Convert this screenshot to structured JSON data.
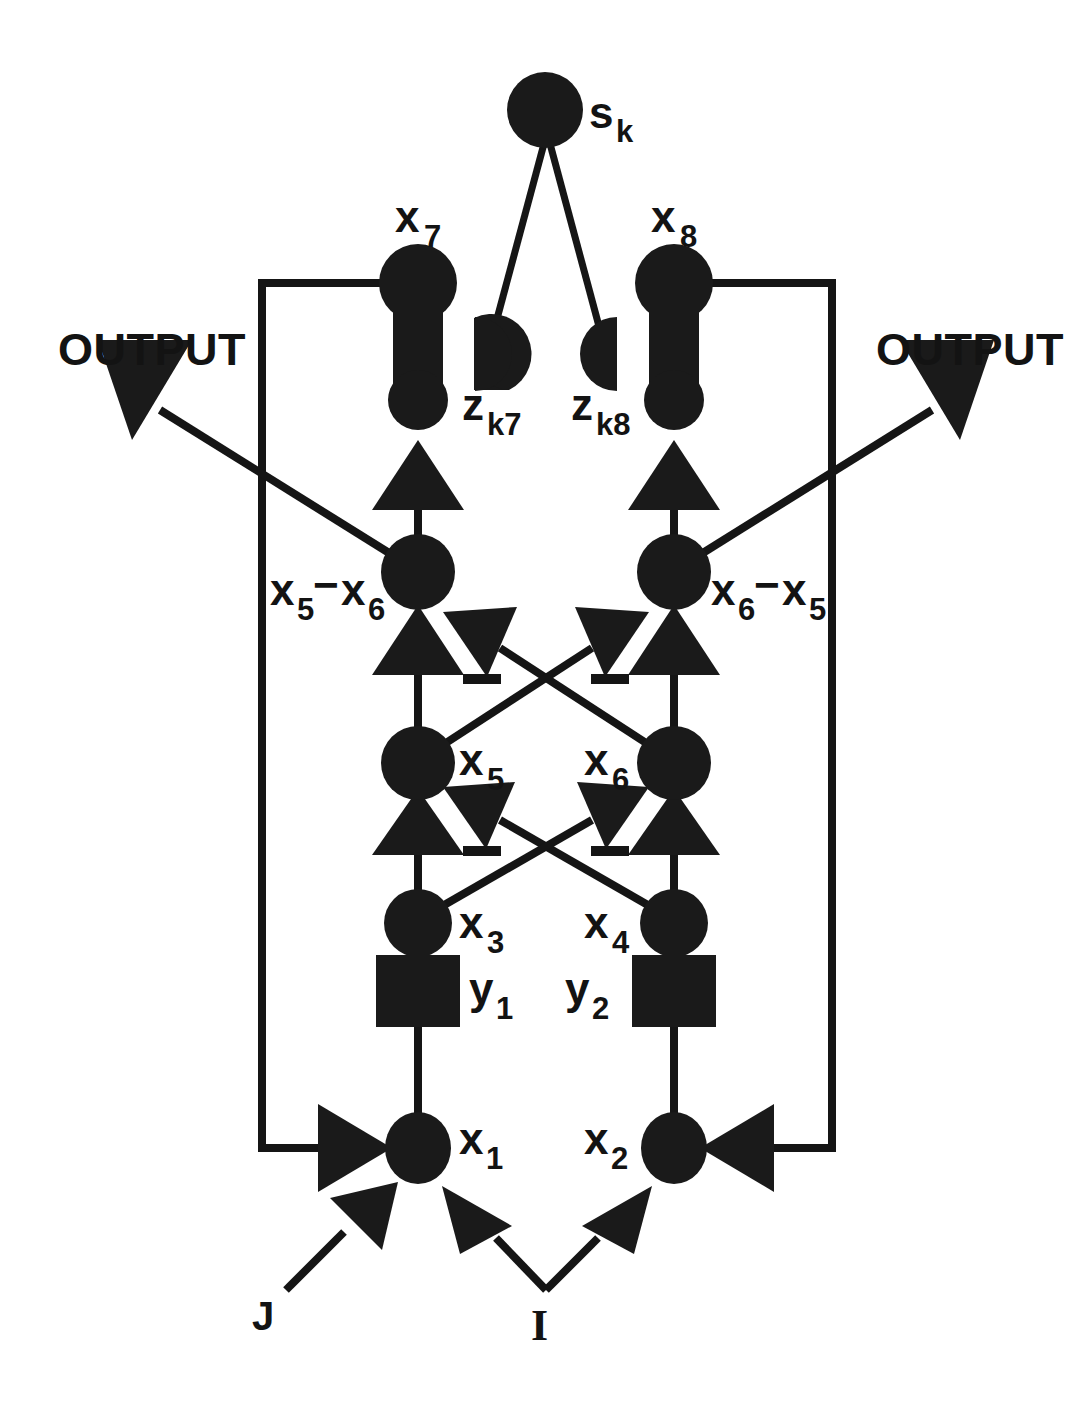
{
  "figure": {
    "type": "neural-circuit-block-diagram",
    "title_visible": false,
    "background_color": "#ffffff",
    "ink_color": "#1a1a1a"
  },
  "nodes": {
    "sk": {
      "label": "s",
      "subscript": "k",
      "shape": "filled-circle",
      "x": 545,
      "y": 110
    },
    "zk7": {
      "label": "z",
      "subscript": "k7",
      "shape": "half-disc-right",
      "x": 492,
      "y": 352
    },
    "zk8": {
      "label": "z",
      "subscript": "k8",
      "shape": "half-disc-left",
      "x": 600,
      "y": 352
    },
    "x7": {
      "label": "x",
      "subscript": "7",
      "shape": "dumbbell",
      "x": 418,
      "y": 283
    },
    "x8": {
      "label": "x",
      "subscript": "8",
      "shape": "dumbbell",
      "x": 674,
      "y": 283
    },
    "x5mx6": {
      "label": "x₅−x₆",
      "left_term": "x",
      "left_sub": "5",
      "op": "−",
      "right_term": "x",
      "right_sub": "6",
      "shape": "filled-circle",
      "x": 418,
      "y": 572
    },
    "x6mx5": {
      "label": "x₆−x₅",
      "left_term": "x",
      "left_sub": "6",
      "op": "−",
      "right_term": "x",
      "right_sub": "5",
      "shape": "filled-circle",
      "x": 674,
      "y": 572
    },
    "x5": {
      "label": "x",
      "subscript": "5",
      "shape": "filled-circle",
      "x": 418,
      "y": 763
    },
    "x6": {
      "label": "x",
      "subscript": "6",
      "shape": "filled-circle",
      "x": 674,
      "y": 763
    },
    "x3": {
      "label": "x",
      "subscript": "3",
      "shape": "filled-circle",
      "x": 418,
      "y": 923
    },
    "x4": {
      "label": "x",
      "subscript": "4",
      "shape": "filled-circle",
      "x": 674,
      "y": 923
    },
    "y1": {
      "label": "y",
      "subscript": "1",
      "shape": "filled-square",
      "x": 418,
      "y": 990
    },
    "y2": {
      "label": "y",
      "subscript": "2",
      "shape": "filled-square",
      "x": 674,
      "y": 990
    },
    "x1": {
      "label": "x",
      "subscript": "1",
      "shape": "filled-circle",
      "x": 418,
      "y": 1148
    },
    "x2": {
      "label": "x",
      "subscript": "2",
      "shape": "filled-circle",
      "x": 674,
      "y": 1148
    }
  },
  "labels": {
    "output_left": "OUTPUT",
    "output_right": "OUTPUT",
    "input_j": "J",
    "input_i": "I",
    "minus_signs": [
      "−",
      "−",
      "−",
      "−"
    ]
  },
  "edges": [
    {
      "from": "sk",
      "to": "zk7",
      "style": "line",
      "sign": ""
    },
    {
      "from": "sk",
      "to": "zk8",
      "style": "line",
      "sign": ""
    },
    {
      "from": "x5mx6",
      "to": "x7",
      "style": "arrow-up",
      "sign": "+"
    },
    {
      "from": "x6mx5",
      "to": "x8",
      "style": "arrow-up",
      "sign": "+"
    },
    {
      "from": "x5",
      "to": "x5mx6",
      "style": "arrow-up",
      "sign": "+"
    },
    {
      "from": "x6",
      "to": "x6mx5",
      "style": "arrow-up",
      "sign": "+"
    },
    {
      "from": "x6",
      "to": "x5mx6",
      "style": "arrow-up-left",
      "sign": "−"
    },
    {
      "from": "x5",
      "to": "x6mx5",
      "style": "arrow-up-right",
      "sign": "−"
    },
    {
      "from": "x3",
      "to": "x5",
      "style": "arrow-up",
      "sign": "+"
    },
    {
      "from": "x4",
      "to": "x6",
      "style": "arrow-up",
      "sign": "+"
    },
    {
      "from": "x4",
      "to": "x5",
      "style": "arrow-up-left",
      "sign": "−"
    },
    {
      "from": "x3",
      "to": "x6",
      "style": "arrow-up-right",
      "sign": "−"
    },
    {
      "from": "y1",
      "to": "x3",
      "style": "line",
      "sign": ""
    },
    {
      "from": "y2",
      "to": "x4",
      "style": "line",
      "sign": ""
    },
    {
      "from": "x1",
      "to": "y1",
      "style": "line",
      "sign": ""
    },
    {
      "from": "x2",
      "to": "y2",
      "style": "line",
      "sign": ""
    },
    {
      "from": "x1",
      "to": "x5mx6",
      "style": "line-vertical",
      "sign": ""
    },
    {
      "from": "x2",
      "to": "x6mx5",
      "style": "line-vertical",
      "sign": ""
    },
    {
      "from": "x7",
      "to": "x1",
      "style": "feedback-loop-left",
      "sign": "+"
    },
    {
      "from": "x8",
      "to": "x2",
      "style": "feedback-loop-right",
      "sign": "+"
    },
    {
      "from": "x5mx6",
      "to": "output_left",
      "style": "arrow-up-left",
      "sign": ""
    },
    {
      "from": "x6mx5",
      "to": "output_right",
      "style": "arrow-up-right",
      "sign": ""
    },
    {
      "from": "input_j",
      "to": "x1",
      "style": "arrow-up-right",
      "sign": "+"
    },
    {
      "from": "input_i",
      "to": "x1",
      "style": "arrow-up-left",
      "sign": "+"
    },
    {
      "from": "input_i",
      "to": "x2",
      "style": "arrow-up-right",
      "sign": "+"
    }
  ]
}
